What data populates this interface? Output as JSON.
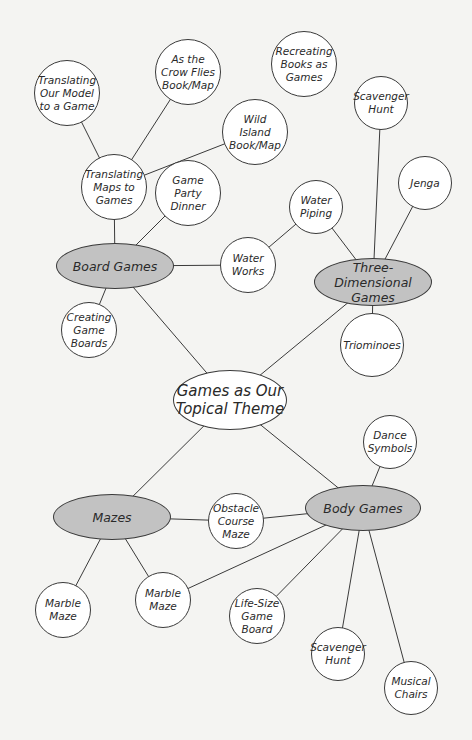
{
  "diagram": {
    "title": "Games as Our Topical Theme",
    "colors": {
      "background": "#f4f4f2",
      "hub_fill": "#c2c2c2",
      "leaf_fill": "#ffffff",
      "stroke": "#3a3a3a"
    },
    "nodes": [
      {
        "id": "center",
        "label": "Games as Our\nTopical Theme",
        "type": "center",
        "x": 230,
        "y": 400,
        "rx": 57,
        "ry": 30
      },
      {
        "id": "board",
        "label": "Board Games",
        "type": "hub",
        "x": 115,
        "y": 266,
        "rx": 59,
        "ry": 23
      },
      {
        "id": "threed",
        "label": "Three-Dimensional\nGames",
        "type": "hub",
        "x": 373,
        "y": 282,
        "rx": 59,
        "ry": 24
      },
      {
        "id": "mazes",
        "label": "Mazes",
        "type": "hub",
        "x": 112,
        "y": 517,
        "rx": 59,
        "ry": 23
      },
      {
        "id": "body",
        "label": "Body Games",
        "type": "hub",
        "x": 363,
        "y": 508,
        "rx": 58,
        "ry": 23
      },
      {
        "id": "model",
        "label": "Translating\nOur Model\nto a Game",
        "type": "leaf",
        "x": 67,
        "y": 93,
        "r": 33
      },
      {
        "id": "crow",
        "label": "As the\nCrow Flies\nBook/Map",
        "type": "leaf",
        "x": 188,
        "y": 72,
        "r": 33
      },
      {
        "id": "recreating",
        "label": "Recreating\nBooks as\nGames",
        "type": "leaf",
        "x": 304,
        "y": 64,
        "r": 33
      },
      {
        "id": "wild",
        "label": "Wild\nIsland\nBook/Map",
        "type": "leaf",
        "x": 255,
        "y": 132,
        "r": 33
      },
      {
        "id": "maps",
        "label": "Translating\nMaps to\nGames",
        "type": "leaf",
        "x": 114,
        "y": 187,
        "r": 33
      },
      {
        "id": "party",
        "label": "Game\nParty\nDinner",
        "type": "leaf",
        "x": 188,
        "y": 193,
        "r": 33
      },
      {
        "id": "scav1",
        "label": "Scavenger\nHunt",
        "type": "leaf",
        "x": 381,
        "y": 103,
        "r": 27
      },
      {
        "id": "jenga",
        "label": "Jenga",
        "type": "leaf",
        "x": 425,
        "y": 183,
        "r": 27
      },
      {
        "id": "piping",
        "label": "Water\nPiping",
        "type": "leaf",
        "x": 316,
        "y": 207,
        "r": 27
      },
      {
        "id": "works",
        "label": "Water\nWorks",
        "type": "leaf",
        "x": 248,
        "y": 265,
        "r": 28
      },
      {
        "id": "creating",
        "label": "Creating\nGame\nBoards",
        "type": "leaf",
        "x": 89,
        "y": 330,
        "r": 28
      },
      {
        "id": "triominoes",
        "label": "Triominoes",
        "type": "leaf",
        "x": 372,
        "y": 345,
        "r": 32
      },
      {
        "id": "dance",
        "label": "Dance\nSymbols",
        "type": "leaf",
        "x": 390,
        "y": 442,
        "r": 27
      },
      {
        "id": "obstacle",
        "label": "Obstacle\nCourse\nMaze",
        "type": "leaf",
        "x": 236,
        "y": 521,
        "r": 28
      },
      {
        "id": "marble1",
        "label": "Marble\nMaze",
        "type": "leaf",
        "x": 63,
        "y": 610,
        "r": 28
      },
      {
        "id": "marble2",
        "label": "Marble\nMaze",
        "type": "leaf",
        "x": 163,
        "y": 600,
        "r": 28
      },
      {
        "id": "lifesize",
        "label": "Life-Size\nGame\nBoard",
        "type": "leaf",
        "x": 257,
        "y": 616,
        "r": 28
      },
      {
        "id": "scav2",
        "label": "Scavenger\nHunt",
        "type": "leaf",
        "x": 338,
        "y": 654,
        "r": 27
      },
      {
        "id": "musical",
        "label": "Musical\nChairs",
        "type": "leaf",
        "x": 411,
        "y": 688,
        "r": 27
      }
    ],
    "edges": [
      [
        "center",
        "board"
      ],
      [
        "center",
        "threed"
      ],
      [
        "center",
        "mazes"
      ],
      [
        "center",
        "body"
      ],
      [
        "board",
        "maps"
      ],
      [
        "board",
        "party"
      ],
      [
        "board",
        "works"
      ],
      [
        "board",
        "creating"
      ],
      [
        "maps",
        "model"
      ],
      [
        "maps",
        "crow"
      ],
      [
        "maps",
        "wild"
      ],
      [
        "works",
        "piping"
      ],
      [
        "piping",
        "threed"
      ],
      [
        "threed",
        "scav1"
      ],
      [
        "threed",
        "jenga"
      ],
      [
        "threed",
        "triominoes"
      ],
      [
        "mazes",
        "obstacle"
      ],
      [
        "mazes",
        "marble1"
      ],
      [
        "mazes",
        "marble2"
      ],
      [
        "body",
        "obstacle"
      ],
      [
        "body",
        "marble2"
      ],
      [
        "body",
        "lifesize"
      ],
      [
        "body",
        "dance"
      ],
      [
        "body",
        "scav2"
      ],
      [
        "body",
        "musical"
      ]
    ]
  }
}
